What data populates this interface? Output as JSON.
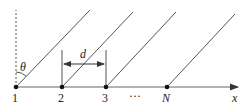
{
  "diagram": {
    "type": "array-of-sources-with-wavefronts",
    "point_labels": [
      "1",
      "2",
      "3",
      "N"
    ],
    "ellipsis": "···",
    "axis_label": "x",
    "angle_label": "θ",
    "spacing_label": "d",
    "colors": {
      "line": "#555555",
      "point": "#111111",
      "text": "#222222"
    }
  }
}
